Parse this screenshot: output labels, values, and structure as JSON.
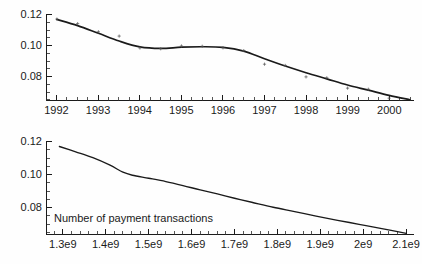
{
  "chart_data": [
    {
      "id": "top-panel",
      "type": "line",
      "title": "",
      "xlabel": "",
      "ylabel": "",
      "xlim": [
        1991.75,
        2000.6
      ],
      "ylim": [
        0.0645,
        0.1205
      ],
      "grid": false,
      "legend": null,
      "x_ticks": [
        "1992",
        "1993",
        "1994",
        "1995",
        "1996",
        "1997",
        "1998",
        "1999",
        "2000"
      ],
      "x_tick_values": [
        1992,
        1993,
        1994,
        1995,
        1996,
        1997,
        1998,
        1999,
        2000
      ],
      "y_ticks": [
        "0.12",
        "0.10",
        "0.08"
      ],
      "y_tick_values": [
        0.12,
        0.1,
        0.08
      ],
      "minor_ticks_per_interval": 4,
      "series": [
        {
          "name": "fitted-curve",
          "kind": "line",
          "x": [
            1992.0,
            1992.5,
            1993.0,
            1993.5,
            1994.0,
            1994.5,
            1995.0,
            1995.5,
            1996.0,
            1996.5,
            1997.0,
            1997.5,
            1998.0,
            1998.5,
            1999.0,
            1999.5,
            2000.0,
            2000.5
          ],
          "values": [
            0.117,
            0.113,
            0.108,
            0.103,
            0.0992,
            0.0982,
            0.099,
            0.0993,
            0.0989,
            0.0965,
            0.0915,
            0.0868,
            0.0825,
            0.0785,
            0.0745,
            0.0712,
            0.0678,
            0.065
          ]
        },
        {
          "name": "observations",
          "kind": "scatter",
          "x": [
            1992.0,
            1992.5,
            1993.0,
            1993.5,
            1994.0,
            1994.5,
            1995.0,
            1995.5,
            1996.0,
            1996.5,
            1997.0,
            1997.5,
            1998.0,
            1998.5,
            1999.0,
            1999.5,
            2000.0
          ],
          "values": [
            0.1172,
            0.1143,
            0.109,
            0.1062,
            0.0985,
            0.098,
            0.0998,
            0.0996,
            0.0986,
            0.0968,
            0.088,
            0.0872,
            0.0798,
            0.0792,
            0.0725,
            0.0718,
            0.066
          ]
        }
      ]
    },
    {
      "id": "bottom-panel",
      "type": "line",
      "title": "",
      "xlabel": "",
      "ylabel": "",
      "annotation": "Number of payment transactions",
      "xlim": [
        1262000000.0,
        2118000000.0
      ],
      "ylim": [
        0.0645,
        0.1205
      ],
      "grid": false,
      "legend": null,
      "x_ticks": [
        "1.3e9",
        "1.4e9",
        "1.5e9",
        "1.6e9",
        "1.7e9",
        "1.8e9",
        "1.9e9",
        "2e9",
        "2.1e9"
      ],
      "x_tick_values": [
        1300000000.0,
        1400000000.0,
        1500000000.0,
        1600000000.0,
        1700000000.0,
        1800000000.0,
        1900000000.0,
        2000000000.0,
        2100000000.0
      ],
      "y_ticks": [
        "0.12",
        "0.10",
        "0.08"
      ],
      "y_tick_values": [
        0.12,
        0.1,
        0.08
      ],
      "minor_ticks_per_interval": 5,
      "series": [
        {
          "name": "fitted-curve",
          "kind": "line",
          "x": [
            1292000000.0,
            1330000000.0,
            1370000000.0,
            1410000000.0,
            1440000000.0,
            1462000000.0,
            1500000000.0,
            1540000000.0,
            1580000000.0,
            1620000000.0,
            1660000000.0,
            1700000000.0,
            1740000000.0,
            1790000000.0,
            1840000000.0,
            1890000000.0,
            1940000000.0,
            1990000000.0,
            2040000000.0,
            2100000000.0
          ],
          "values": [
            0.1172,
            0.114,
            0.1105,
            0.106,
            0.1018,
            0.1,
            0.0982,
            0.0962,
            0.0938,
            0.0912,
            0.0888,
            0.0862,
            0.0838,
            0.0808,
            0.0782,
            0.0755,
            0.073,
            0.0706,
            0.0682,
            0.0652
          ]
        }
      ]
    }
  ]
}
